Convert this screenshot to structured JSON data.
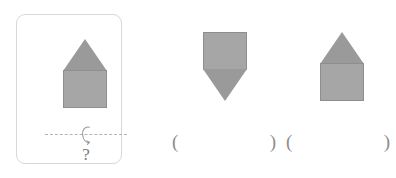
{
  "task": {
    "type": "mirror-flip-shape-puzzle",
    "prompt_card": {
      "figure_name": "house-shape",
      "figure_description": "triangle on top of square",
      "axis_symbol": "flip-axis-horizontal",
      "flip_icon_name": "vertical-flip-arrow-icon",
      "question_text": "?"
    },
    "options": [
      {
        "index": 0,
        "figure_name": "square-over-downward-triangle",
        "figure_description": "square on top with downward pointing triangle below",
        "answer_open_paren": "(",
        "answer_close_paren": ")",
        "answer_value": ""
      },
      {
        "index": 1,
        "figure_name": "house-shape",
        "figure_description": "triangle on top of square",
        "answer_open_paren": "(",
        "answer_close_paren": ")",
        "answer_value": ""
      }
    ]
  },
  "colors": {
    "background": "#ffffff",
    "shape_fill": "#a6a6a6",
    "triangle_fill": "#9a9a9a",
    "shape_stroke": "#8e8e8e",
    "card_border": "#d8d8d8",
    "axis_dash": "#b3b3b3",
    "text_gray": "#8c8c8c"
  }
}
